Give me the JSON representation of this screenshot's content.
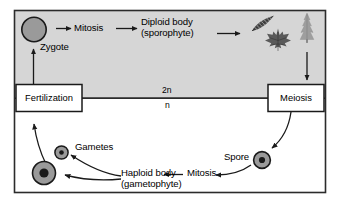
{
  "diagram": {
    "frame": {
      "border_color": "#2b2b2b",
      "outer_bg": "#ffffff"
    },
    "regions": [
      {
        "name": "diploid-region",
        "ploidy_label": "2n",
        "bg_color": "#d6d6d6"
      },
      {
        "name": "haploid-region",
        "ploidy_label": "n",
        "bg_color": "#ffffff"
      }
    ],
    "boxes": [
      {
        "key": "fertilization",
        "label": "Fertilization"
      },
      {
        "key": "meiosis",
        "label": "Meiosis"
      }
    ],
    "labels": {
      "zygote": "Zygote",
      "mitosis_top": "Mitosis",
      "diploid_body_line1": "Diploid body",
      "diploid_body_line2": "(sporophyte)",
      "gametes": "Gametes",
      "haploid_body_line1": "Haploid body",
      "haploid_body_line2": "(gametophyte)",
      "mitosis_bottom": "Mitosis",
      "spore": "Spore",
      "ploidy_diploid": "2n",
      "ploidy_haploid": "n"
    },
    "cells": [
      {
        "key": "zygote-cell",
        "fill": "#9a9a9a",
        "stroke": "#1a1a1a",
        "has_nucleus": false
      },
      {
        "key": "egg-cell",
        "fill": "#9a9a9a",
        "stroke": "#1a1a1a",
        "has_nucleus": true
      },
      {
        "key": "sperm-cell",
        "fill": "#9a9a9a",
        "stroke": "#1a1a1a",
        "has_nucleus": true
      },
      {
        "key": "spore-cell",
        "fill": "#9a9a9a",
        "stroke": "#1a1a1a",
        "has_nucleus": true
      }
    ],
    "plants": [
      {
        "key": "fern-frond-icon",
        "fill": "#4a4a4a"
      },
      {
        "key": "maple-leaf-icon",
        "fill": "#5a5a5a"
      },
      {
        "key": "conifer-tree-icon",
        "fill": "#9e9e9e"
      }
    ],
    "arrow_color": "#1a1a1a"
  }
}
